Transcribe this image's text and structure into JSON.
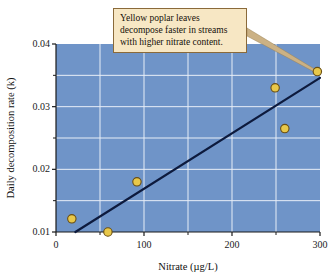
{
  "chart_data": {
    "type": "scatter",
    "title": "",
    "xlabel": "Nitrate (µg/L)",
    "ylabel": "Daily decomposition rate (k)",
    "xlim": [
      0,
      300
    ],
    "ylim": [
      0.01,
      0.04
    ],
    "grid": true,
    "legend": "none",
    "x_ticks": [
      0,
      100,
      200,
      300
    ],
    "x_tick_labels": [
      "0",
      "100",
      "200",
      "300"
    ],
    "x_minor_ticks": [
      50,
      150,
      250
    ],
    "y_ticks": [
      0.01,
      0.02,
      0.03,
      0.04
    ],
    "y_tick_labels": [
      "0.01",
      "0.02",
      "0.03",
      "0.04"
    ],
    "y_minor_ticks": [
      0.015,
      0.025,
      0.035
    ],
    "points": [
      {
        "x": 18,
        "y": 0.0121
      },
      {
        "x": 59,
        "y": 0.01
      },
      {
        "x": 92,
        "y": 0.018
      },
      {
        "x": 249,
        "y": 0.033
      },
      {
        "x": 260,
        "y": 0.0265
      },
      {
        "x": 297,
        "y": 0.0356
      }
    ],
    "fit_line": {
      "name": "least-squares regression line",
      "x_start": 22,
      "y_start": 0.01,
      "x_end": 300,
      "y_end": 0.0346
    },
    "annotation": {
      "lines": [
        "Yellow poplar leaves",
        "decompose faster in streams",
        "with higher nitrate content."
      ],
      "points_to": {
        "x": 297,
        "y": 0.0356
      }
    },
    "colors": {
      "plot_background": "#6f94c8",
      "gridline": "#e8eef7",
      "marker_fill": "#e8c84a",
      "marker_edge": "#6b4f12",
      "fit_line": "#0d1a3d",
      "annotation_background": "#f7e7c4",
      "annotation_border": "#8a6a3a",
      "leader_line": "#cbb184",
      "axis": "#1a1a1a",
      "text": "#111111"
    }
  },
  "axes": {
    "x_title": "Nitrate (µg/L)",
    "y_title": "Daily decomposition rate (k)"
  },
  "annotation": {
    "line1": "Yellow poplar leaves",
    "line2": "decompose faster in streams",
    "line3": "with higher nitrate content."
  },
  "ticks": {
    "y": [
      "0.04",
      "0.03",
      "0.02",
      "0.01"
    ],
    "x": [
      "0",
      "100",
      "200",
      "300"
    ]
  }
}
